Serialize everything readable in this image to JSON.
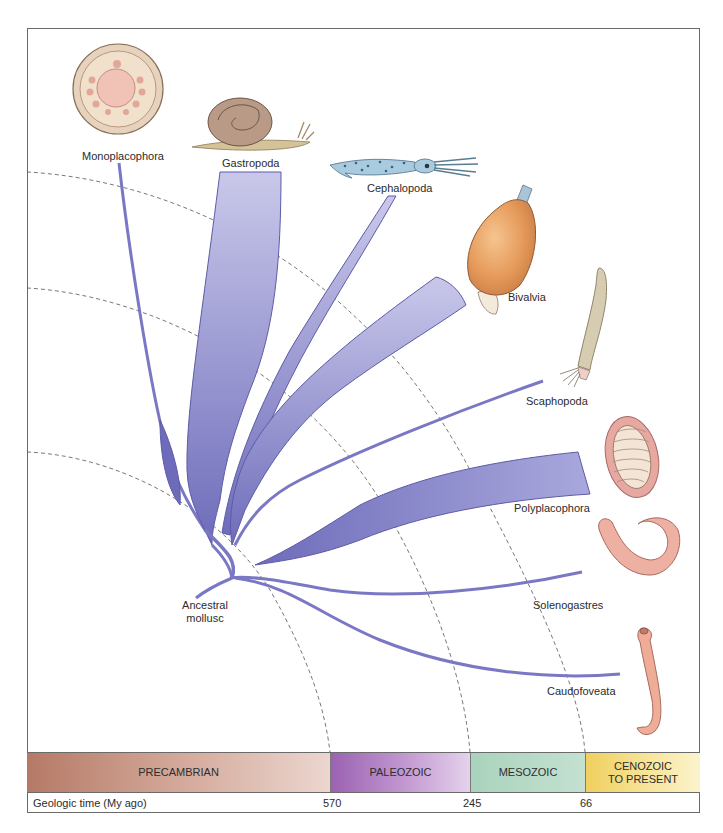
{
  "diagram": {
    "type": "phylogenetic-tree",
    "root_label": [
      "Ancestral",
      "mollusc"
    ],
    "branch_color": "#7a78c4",
    "branch_stroke": "#5d5ba8",
    "taxa": [
      {
        "name": "Monoplacophora",
        "illustration": "monoplacophoran-shell-icon"
      },
      {
        "name": "Gastropoda",
        "illustration": "snail-icon"
      },
      {
        "name": "Cephalopoda",
        "illustration": "squid-icon"
      },
      {
        "name": "Bivalvia",
        "illustration": "clam-icon"
      },
      {
        "name": "Scaphopoda",
        "illustration": "tusk-shell-icon"
      },
      {
        "name": "Polyplacophora",
        "illustration": "chiton-icon"
      },
      {
        "name": "Solenogastres",
        "illustration": "solenogaster-worm-icon"
      },
      {
        "name": "Caudofoveata",
        "illustration": "caudofoveate-worm-icon"
      }
    ]
  },
  "timeline": {
    "eras": [
      {
        "label": "PRECAMBRIAN",
        "color": "#c99483"
      },
      {
        "label": "PALEOZOIC",
        "color": "#b07fc4"
      },
      {
        "label": "MESOZOIC",
        "color": "#b7dac6"
      },
      {
        "label": "CENOZOIC",
        "label2": "TO PRESENT",
        "color": "#f4dc85"
      }
    ],
    "axis_label": "Geologic time (My ago)",
    "ticks": [
      "570",
      "245",
      "66"
    ]
  }
}
